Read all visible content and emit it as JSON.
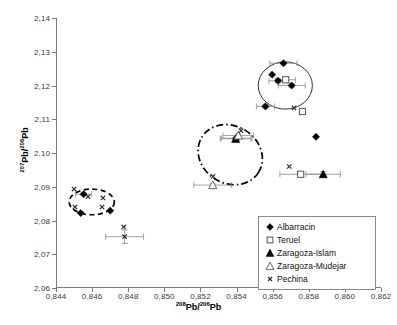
{
  "chart_data": {
    "type": "scatter",
    "title": "",
    "xlabel": "208Pb/206Pb",
    "ylabel": "207Pb/206Pb",
    "xlabel_parts": {
      "sup1": "208",
      "mid": "Pb/",
      "sup2": "206",
      "end": "Pb"
    },
    "ylabel_parts": {
      "sup1": "207",
      "mid": "Pb/",
      "sup2": "206",
      "end": "Pb"
    },
    "xlim": [
      0.844,
      0.862
    ],
    "ylim": [
      2.06,
      2.14
    ],
    "xticks": [
      "0,844",
      "0,846",
      "0,848",
      "0,850",
      "0,852",
      "0,854",
      "0,856",
      "0,858",
      "0,860",
      "0,862"
    ],
    "xtick_values": [
      0.844,
      0.846,
      0.848,
      0.85,
      0.852,
      0.854,
      0.856,
      0.858,
      0.86,
      0.862
    ],
    "yticks": [
      "2,06",
      "2,07",
      "2,08",
      "2,09",
      "2,10",
      "2,11",
      "2,12",
      "2,13",
      "2,14"
    ],
    "ytick_values": [
      2.06,
      2.07,
      2.08,
      2.09,
      2.1,
      2.11,
      2.12,
      2.13,
      2.14
    ],
    "grid": false,
    "legend_position": "bottom-right",
    "error_bars": true,
    "series": [
      {
        "name": "Albarracin",
        "marker": "filled-diamond",
        "color": "#000000",
        "points": [
          {
            "x": 0.84553,
            "y": 2.0878,
            "xerr": 0.00045,
            "yerr": 0.0004
          },
          {
            "x": 0.84537,
            "y": 2.0822,
            "xerr": 0.0,
            "yerr": 0.0
          },
          {
            "x": 0.847,
            "y": 2.0829,
            "xerr": 0.0,
            "yerr": 0.0
          },
          {
            "x": 0.854,
            "y": 2.1044,
            "xerr": 0.00085,
            "yerr": 0.0006
          },
          {
            "x": 0.85398,
            "y": 2.1042,
            "xerr": 0.0,
            "yerr": 0.0
          },
          {
            "x": 0.8566,
            "y": 2.1266,
            "xerr": 0.00075,
            "yerr": 0.0005
          },
          {
            "x": 0.85597,
            "y": 2.1232,
            "xerr": 0.0,
            "yerr": 0.0
          },
          {
            "x": 0.8563,
            "y": 2.1214,
            "xerr": 0.0005,
            "yerr": 0.0006
          },
          {
            "x": 0.85705,
            "y": 2.12,
            "xerr": 0.00075,
            "yerr": 0.0005
          },
          {
            "x": 0.8556,
            "y": 2.1138,
            "xerr": 0.0005,
            "yerr": 0.0005
          },
          {
            "x": 0.8584,
            "y": 2.1048,
            "xerr": 0.0,
            "yerr": 0.0
          }
        ]
      },
      {
        "name": "Teruel",
        "marker": "open-square",
        "color": "#555555",
        "points": [
          {
            "x": 0.85672,
            "y": 2.1217,
            "xerr": 0.00055,
            "yerr": 0.0006
          },
          {
            "x": 0.85765,
            "y": 2.1123,
            "xerr": 0.0,
            "yerr": 0.0
          },
          {
            "x": 0.85755,
            "y": 2.0937,
            "xerr": 0.00115,
            "yerr": 0.0005
          }
        ]
      },
      {
        "name": "Zaragoza-Islam",
        "marker": "filled-triangle",
        "color": "#000000",
        "points": [
          {
            "x": 0.85395,
            "y": 2.1042,
            "xerr": 0.00085,
            "yerr": 0.0005
          },
          {
            "x": 0.8588,
            "y": 2.0937,
            "xerr": 0.00095,
            "yerr": 0.0008
          }
        ]
      },
      {
        "name": "Zaragoza-Mudejar",
        "marker": "open-triangle",
        "color": "#6a6a6a",
        "points": [
          {
            "x": 0.8541,
            "y": 2.1052,
            "xerr": 0.00085,
            "yerr": 0.0005
          },
          {
            "x": 0.85268,
            "y": 2.0905,
            "xerr": 0.00105,
            "yerr": 0.0004
          }
        ]
      },
      {
        "name": "Pechina",
        "marker": "cross-x",
        "color": "#303030",
        "points": [
          {
            "x": 0.845,
            "y": 2.0893,
            "xerr": 0.0,
            "yerr": 0.0
          },
          {
            "x": 0.84577,
            "y": 2.0871,
            "xerr": 0.0,
            "yerr": 0.0
          },
          {
            "x": 0.8466,
            "y": 2.0867,
            "xerr": 0.0,
            "yerr": 0.0
          },
          {
            "x": 0.84505,
            "y": 2.084,
            "xerr": 0.0,
            "yerr": 0.0
          },
          {
            "x": 0.84655,
            "y": 2.084,
            "xerr": 0.0,
            "yerr": 0.0
          },
          {
            "x": 0.84775,
            "y": 2.0781,
            "xerr": 0.0,
            "yerr": 0.0
          },
          {
            "x": 0.8478,
            "y": 2.0752,
            "xerr": 0.00105,
            "yerr": 0.002
          },
          {
            "x": 0.8527,
            "y": 2.0931,
            "xerr": 0.0,
            "yerr": 0.0
          },
          {
            "x": 0.85425,
            "y": 2.1066,
            "xerr": 0.0,
            "yerr": 0.0
          },
          {
            "x": 0.85718,
            "y": 2.1134,
            "xerr": 0.0,
            "yerr": 0.0
          },
          {
            "x": 0.85692,
            "y": 2.096,
            "xerr": 0.0,
            "yerr": 0.0
          }
        ]
      }
    ],
    "annotations": [
      {
        "kind": "ellipse",
        "name": "albarracin-cluster-ellipse",
        "style": "dashed",
        "cx": 0.84598,
        "cy": 2.0855,
        "rx": 0.00125,
        "ry": 0.0038,
        "rotation": 0
      },
      {
        "kind": "ellipse",
        "name": "mudejar-cluster-ellipse",
        "style": "dash-dot",
        "cx": 0.85365,
        "cy": 2.0995,
        "rx": 0.00185,
        "ry": 0.0085,
        "rotation": 32
      },
      {
        "kind": "ellipse",
        "name": "islam-cluster-ellipse",
        "style": "solid",
        "cx": 0.8567,
        "cy": 2.12,
        "rx": 0.0015,
        "ry": 0.007,
        "rotation": 0
      }
    ]
  },
  "legend": {
    "title": "",
    "items": [
      {
        "label": "Albarracin",
        "marker": "filled-diamond"
      },
      {
        "label": "Teruel",
        "marker": "open-square"
      },
      {
        "label": "Zaragoza-Islam",
        "marker": "filled-triangle"
      },
      {
        "label": "Zaragoza-Mudejar",
        "marker": "open-triangle"
      },
      {
        "label": "Pechina",
        "marker": "cross-x"
      }
    ]
  }
}
